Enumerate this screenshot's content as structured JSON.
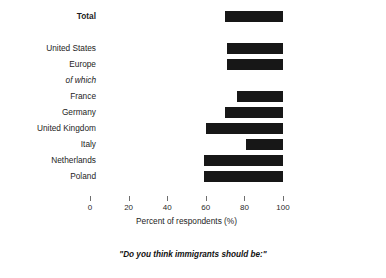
{
  "chart_data": {
    "type": "bar",
    "orientation": "horizontal",
    "title": "",
    "subtitle": "",
    "caption": "\"Do you think immigrants should be:\"",
    "xlabel": "Percent of respondents (%)",
    "ylabel": "",
    "xlim": [
      0,
      100
    ],
    "xticks": [
      0,
      20,
      40,
      60,
      80,
      100
    ],
    "xtick_labels": [
      "0",
      "20",
      "40",
      "60",
      "80",
      "100"
    ],
    "grid": false,
    "legend": false,
    "bar_color": "#171717",
    "note": "Each bar is drawn as a floating segment from its start value to 100%.",
    "categories": [
      "Total",
      "United States",
      "Europe",
      "of which",
      "France",
      "Germany",
      "United Kingdom",
      "Italy",
      "Netherlands",
      "Poland"
    ],
    "bars": [
      {
        "label": "Total",
        "start": 70,
        "end": 100,
        "value": 30,
        "style": "bold",
        "has_bar": true,
        "y": 9
      },
      {
        "label": "United States",
        "start": 71,
        "end": 100,
        "value": 29,
        "style": "normal",
        "has_bar": true,
        "y": 41
      },
      {
        "label": "Europe",
        "start": 71,
        "end": 100,
        "value": 29,
        "style": "normal",
        "has_bar": true,
        "y": 57
      },
      {
        "label": "of which",
        "start": 0,
        "end": 0,
        "value": 0,
        "style": "italic",
        "has_bar": false,
        "y": 73
      },
      {
        "label": "France",
        "start": 76,
        "end": 100,
        "value": 24,
        "style": "normal",
        "has_bar": true,
        "y": 89
      },
      {
        "label": "Germany",
        "start": 70,
        "end": 100,
        "value": 30,
        "style": "normal",
        "has_bar": true,
        "y": 105
      },
      {
        "label": "United Kingdom",
        "start": 60,
        "end": 100,
        "value": 40,
        "style": "normal",
        "has_bar": true,
        "y": 121
      },
      {
        "label": "Italy",
        "start": 81,
        "end": 100,
        "value": 19,
        "style": "normal",
        "has_bar": true,
        "y": 137
      },
      {
        "label": "Netherlands",
        "start": 59,
        "end": 100,
        "value": 41,
        "style": "normal",
        "has_bar": true,
        "y": 153
      },
      {
        "label": "Poland",
        "start": 59,
        "end": 100,
        "value": 41,
        "style": "normal",
        "has_bar": true,
        "y": 169
      }
    ]
  }
}
